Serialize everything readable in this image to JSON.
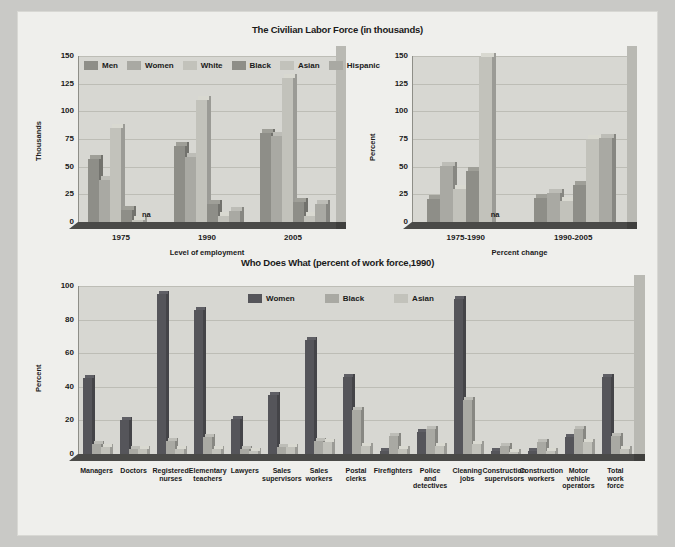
{
  "page": {
    "background_color": "#efefec",
    "outer_color": "#c9c9c6"
  },
  "palette": {
    "men": "#8e8e88",
    "women": "#a9a9a3",
    "white": "#c2c2bb",
    "black": "#8e8e88",
    "asian": "#c2c2bb",
    "hispanic": "#a9a9a3",
    "women_dark": "#55555a",
    "black_mid": "#a9a9a3",
    "asian_light": "#c2c2bb",
    "floor": "#4a4a48",
    "plot_face": "#d7d7d2",
    "grid": "#bdbdb6"
  },
  "chart_data": [
    {
      "id": "labor-force-level",
      "type": "bar",
      "title": "The Civilian Labor Force (in thousands)",
      "xlabel": "Level of employment",
      "ylabel": "Thousands",
      "ylim": [
        0,
        150
      ],
      "yticks": [
        0,
        25,
        50,
        75,
        100,
        125,
        150
      ],
      "grid": true,
      "legend_position": "top-inside",
      "categories": [
        "1975",
        "1990",
        "2005"
      ],
      "series": [
        {
          "name": "Men",
          "color": "#8e8e88",
          "values": [
            57,
            69,
            80
          ]
        },
        {
          "name": "Women",
          "color": "#a9a9a3",
          "values": [
            38,
            59,
            78
          ]
        },
        {
          "name": "White",
          "color": "#c2c2bb",
          "values": [
            85,
            110,
            130
          ]
        },
        {
          "name": "Black",
          "color": "#8e8e88",
          "values": [
            11,
            16,
            18
          ]
        },
        {
          "name": "Asian",
          "color": "#c2c2bb",
          "values": [
            2,
            5,
            5
          ]
        },
        {
          "name": "Hispanic",
          "color": "#a9a9a3",
          "values": [
            null,
            10,
            16
          ]
        }
      ],
      "annotations": [
        {
          "text": "na",
          "category": "1975",
          "series": "Hispanic"
        }
      ]
    },
    {
      "id": "labor-force-percent-change",
      "type": "bar",
      "title": "",
      "xlabel": "Percent change",
      "ylabel": "Percent",
      "ylim": [
        0,
        150
      ],
      "yticks": [
        0,
        25,
        50,
        75,
        100,
        125,
        150
      ],
      "grid": true,
      "categories": [
        "1975-1990",
        "1990-2005"
      ],
      "series": [
        {
          "name": "Men",
          "color": "#8e8e88",
          "values": [
            21,
            22
          ]
        },
        {
          "name": "Women",
          "color": "#a9a9a3",
          "values": [
            51,
            26
          ]
        },
        {
          "name": "White",
          "color": "#c2c2bb",
          "values": [
            30,
            19
          ]
        },
        {
          "name": "Black",
          "color": "#8e8e88",
          "values": [
            46,
            33
          ]
        },
        {
          "name": "Asian",
          "color": "#c2c2bb",
          "values": [
            149,
            75
          ]
        },
        {
          "name": "Hispanic",
          "color": "#a9a9a3",
          "values": [
            null,
            76
          ]
        }
      ],
      "annotations": [
        {
          "text": "na",
          "category": "1975-1990",
          "series": "Hispanic"
        }
      ]
    },
    {
      "id": "who-does-what",
      "type": "bar",
      "title": "Who Does What (percent of work force,1990)",
      "xlabel": "",
      "ylabel": "Percent",
      "ylim": [
        0,
        100
      ],
      "yticks": [
        0,
        20,
        40,
        60,
        80,
        100
      ],
      "grid": true,
      "legend_position": "top-center",
      "categories": [
        "Managers",
        "Doctors",
        "Registered nurses",
        "Elementary teachers",
        "Lawyers",
        "Sales supervisors",
        "Sales workers",
        "Postal clerks",
        "Firefighters",
        "Police and detectives",
        "Cleaning jobs",
        "Construction supervisors",
        "Construction workers",
        "Motor vehicle operators",
        "Total work force"
      ],
      "categories_display": [
        [
          "Managers"
        ],
        [
          "Doctors"
        ],
        [
          "Registered",
          "nurses"
        ],
        [
          "Elementary",
          "teachers"
        ],
        [
          "Lawyers"
        ],
        [
          "Sales",
          "supervisors"
        ],
        [
          "Sales",
          "workers"
        ],
        [
          "Postal",
          "clerks"
        ],
        [
          "Firefighters"
        ],
        [
          "Police",
          "and",
          "detectives"
        ],
        [
          "Cleaning",
          "jobs"
        ],
        [
          "Construction",
          "supervisors"
        ],
        [
          "Construction",
          "workers"
        ],
        [
          "Motor",
          "vehicle",
          "operators"
        ],
        [
          "Total",
          "work",
          "force"
        ]
      ],
      "series": [
        {
          "name": "Women",
          "color": "#55555a",
          "values": [
            45,
            20,
            95,
            86,
            21,
            35,
            68,
            46,
            2,
            13,
            92,
            2,
            2,
            10,
            46
          ]
        },
        {
          "name": "Black",
          "color": "#a9a9a3",
          "values": [
            6,
            3,
            8,
            10,
            3,
            4,
            8,
            26,
            11,
            15,
            32,
            5,
            7,
            15,
            11
          ]
        },
        {
          "name": "Asian",
          "color": "#c2c2bb",
          "values": [
            4,
            3,
            3,
            3,
            2,
            4,
            7,
            5,
            3,
            5,
            6,
            1,
            2,
            7,
            3
          ]
        }
      ]
    }
  ]
}
